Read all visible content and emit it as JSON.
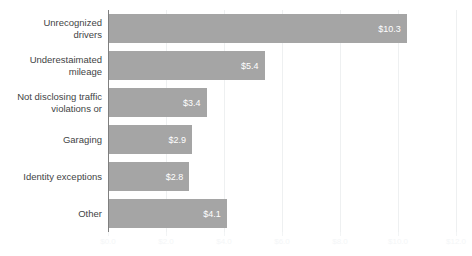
{
  "chart_data": {
    "type": "bar",
    "orientation": "horizontal",
    "title": "",
    "subtitle": "",
    "xlabel": "",
    "ylabel": "",
    "categories": [
      "Unrecognized drivers",
      "Underestaimated mileage",
      "Not disclosing traffic violations or",
      "Garaging",
      "Identity exceptions",
      "Other"
    ],
    "category_lines": [
      [
        "Unrecognized",
        "drivers"
      ],
      [
        "Underestaimated",
        "mileage"
      ],
      [
        "Not disclosing traffic",
        "violations or"
      ],
      [
        "Garaging"
      ],
      [
        "Identity exceptions"
      ],
      [
        "Other"
      ]
    ],
    "values": [
      10.3,
      5.4,
      3.4,
      2.9,
      2.8,
      4.1
    ],
    "data_labels": [
      "$10.3",
      "$5.4",
      "$3.4",
      "$2.9",
      "$2.8",
      "$4.1"
    ],
    "xlim": [
      0.0,
      12.0
    ],
    "xticks": [
      0.0,
      2.0,
      4.0,
      6.0,
      8.0,
      10.0,
      12.0
    ],
    "xticklabels": [
      "$0.0",
      "$2.0",
      "$4.0",
      "$6.0",
      "$8.0",
      "$10.0",
      "$12.0"
    ],
    "grid": true,
    "grid_axis": "x",
    "legend": false,
    "legend_position": "none",
    "series": [
      {
        "name": "Amount",
        "values": [
          10.3,
          5.4,
          3.4,
          2.9,
          2.8,
          4.1
        ]
      }
    ]
  },
  "style": {
    "bar_color": "#a5a5a5",
    "bar_label_color": "#ffffff",
    "category_label_color": "#3f4445",
    "gridline_color": "#eef0f1",
    "axis_line_color": "#7f7f7f",
    "tick_label_color": "#f4f6f7",
    "background": "#ffffff"
  }
}
